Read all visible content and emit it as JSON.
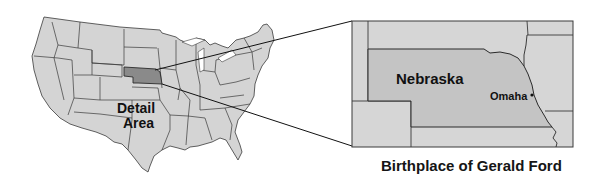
{
  "us_map": {
    "highlighted_state": "Nebraska",
    "label_line1": "Detail",
    "label_line2": "Area"
  },
  "detail_map": {
    "state_label": "Nebraska",
    "city_label": "Omaha"
  },
  "caption": "Birthplace of Gerald Ford",
  "colors": {
    "state_fill": "#d4d4d4",
    "highlight_fill": "#8a8a8a",
    "border": "#3a3a3a",
    "detail_fill": "#c4c4c4"
  }
}
